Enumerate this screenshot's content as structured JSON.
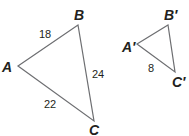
{
  "triangle_large": {
    "vertices": {
      "A": "A",
      "B": "B",
      "C": "C"
    },
    "sides": {
      "AB": "18",
      "BC": "24",
      "AC": "22"
    }
  },
  "triangle_small": {
    "vertices": {
      "A": "A′",
      "B": "B′",
      "C": "C′"
    },
    "sides": {
      "AC": "8"
    }
  },
  "colors": {
    "stroke": "#6d6e71",
    "text": "#231f20"
  }
}
